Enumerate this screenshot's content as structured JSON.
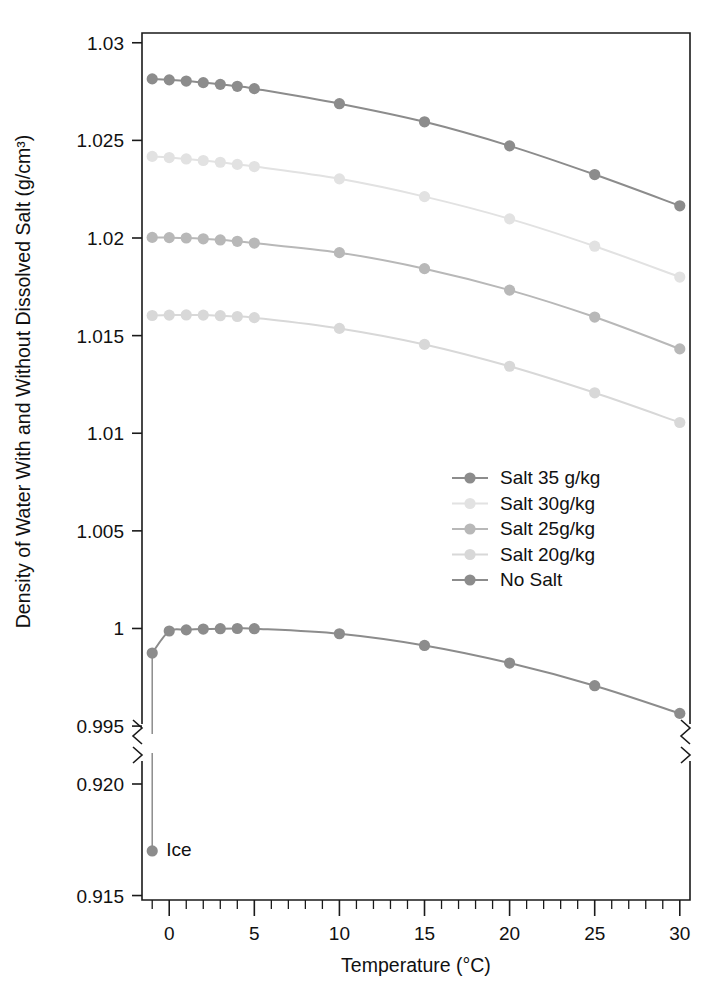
{
  "chart_data": {
    "type": "line",
    "title": "",
    "xlabel": "Temperature (°C)",
    "ylabel": "Density of Water With and Without Dissolved Salt (g/cm³)",
    "xlim": [
      -1.6,
      30.6
    ],
    "x_major_ticks": [
      0,
      5,
      10,
      15,
      20,
      25,
      30
    ],
    "x_major_tick_labels": [
      "0",
      "5",
      "10",
      "15",
      "20",
      "25",
      "30"
    ],
    "x_minor_tick_step": 1,
    "broken_axis": true,
    "upper_panel": {
      "ylim": [
        0.9948,
        1.0305
      ],
      "y_ticks": [
        0.995,
        1.0,
        1.005,
        1.01,
        1.015,
        1.02,
        1.025,
        1.03
      ],
      "y_tick_labels": [
        "0.995",
        "1",
        "1.005",
        "1.01",
        "1.015",
        "1.02",
        "1.025",
        "1.03"
      ]
    },
    "lower_panel": {
      "ylim": [
        0.9148,
        0.9213
      ],
      "y_ticks": [
        0.915,
        0.92
      ],
      "y_tick_labels": [
        "0.915",
        "0.920"
      ]
    },
    "grid": false,
    "legend_position": "center-right",
    "series": [
      {
        "name": "Salt 35 g/kg",
        "color": "#8c8c8c",
        "x": [
          -1,
          0,
          1,
          2,
          3,
          4,
          5,
          10,
          15,
          20,
          25,
          30
        ],
        "values": [
          1.02815,
          1.0281,
          1.02804,
          1.02796,
          1.02787,
          1.02777,
          1.02765,
          1.02688,
          1.02595,
          1.02472,
          1.02325,
          1.02165
        ]
      },
      {
        "name": "Salt 30g/kg",
        "color": "#e2e2e2",
        "x": [
          -1,
          0,
          1,
          2,
          3,
          4,
          5,
          10,
          15,
          20,
          25,
          30
        ],
        "values": [
          1.02418,
          1.02412,
          1.02405,
          1.02397,
          1.02388,
          1.02377,
          1.02366,
          1.02303,
          1.02212,
          1.02098,
          1.01958,
          1.018
        ]
      },
      {
        "name": "Salt 25g/kg",
        "color": "#b8b8b8",
        "x": [
          -1,
          0,
          1,
          2,
          3,
          4,
          5,
          10,
          15,
          20,
          25,
          30
        ],
        "values": [
          1.02003,
          1.02002,
          1.02,
          1.01996,
          1.0199,
          1.01983,
          1.01974,
          1.01925,
          1.01843,
          1.01733,
          1.01595,
          1.01432
        ]
      },
      {
        "name": "Salt 20g/kg",
        "color": "#d8d8d8",
        "x": [
          -1,
          0,
          1,
          2,
          3,
          4,
          5,
          10,
          15,
          20,
          25,
          30
        ],
        "values": [
          1.01603,
          1.01605,
          1.01606,
          1.01605,
          1.01602,
          1.01598,
          1.01592,
          1.01537,
          1.01455,
          1.01343,
          1.01207,
          1.01055
        ]
      },
      {
        "name": "No Salt",
        "color": "#8c8c8c",
        "x": [
          -1,
          0,
          1,
          2,
          3,
          4,
          5,
          10,
          15,
          20,
          25,
          30
        ],
        "values": [
          0.99874,
          0.99987,
          0.99993,
          0.99997,
          0.99999,
          1.0,
          0.99999,
          0.99973,
          0.99913,
          0.99823,
          0.99707,
          0.99565
        ]
      }
    ],
    "annotations": [
      {
        "label": "Ice",
        "x": -1,
        "y": 0.917,
        "panel": "lower",
        "color": "#8c8c8c",
        "note": "Ice density point connected by a vertical drop line from the No Salt curve at -1 °C"
      }
    ],
    "legend_entries": [
      {
        "label": "Salt 35 g/kg",
        "color": "#8c8c8c"
      },
      {
        "label": "Salt 30g/kg",
        "color": "#e2e2e2"
      },
      {
        "label": "Salt 25g/kg",
        "color": "#b8b8b8"
      },
      {
        "label": "Salt 20g/kg",
        "color": "#d8d8d8"
      },
      {
        "label": "No Salt",
        "color": "#8c8c8c"
      }
    ]
  }
}
